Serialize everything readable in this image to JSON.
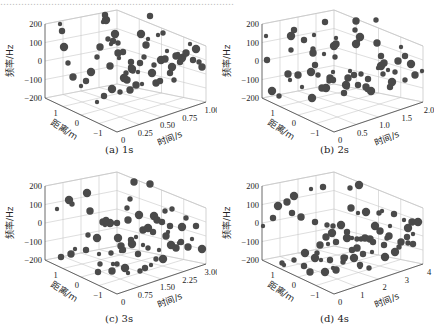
{
  "figure": {
    "top_text_fragment": "……………………………………………………………………",
    "panels": [
      {
        "id": "a",
        "caption": "(a) 1s",
        "time_ticks": [
          "0",
          "0.25",
          "0.50",
          "0.75",
          "1.00"
        ]
      },
      {
        "id": "b",
        "caption": "(b) 2s",
        "time_ticks": [
          "0",
          "0.5",
          "1.0",
          "1.5",
          "2.0"
        ]
      },
      {
        "id": "c",
        "caption": "(c) 3s",
        "time_ticks": [
          "0",
          "0.75",
          "1.50",
          "2.25",
          "3.00"
        ]
      },
      {
        "id": "d",
        "caption": "(d) 4s",
        "time_ticks": [
          "0",
          "1",
          "2",
          "3",
          "4"
        ]
      }
    ],
    "z_label": "频率/Hz",
    "y_label": "距离/m",
    "x_label": "时间/s",
    "z_ticks": [
      "200",
      "100",
      "0",
      "−100",
      "−200"
    ],
    "y_ticks": [
      "1",
      "0",
      "−1"
    ],
    "point_color": "#4a4a4a",
    "grid_color": "#c8c8c8"
  },
  "chart_data": [
    {
      "type": "scatter",
      "title": "(a) 1s",
      "xlabel": "时间/s",
      "ylabel": "距离/m",
      "zlabel": "频率/Hz",
      "xlim": [
        0,
        1.0
      ],
      "ylim": [
        -1.5,
        1.5
      ],
      "zlim": [
        -200,
        200
      ],
      "x_ticks": [
        0,
        0.25,
        0.5,
        0.75,
        1.0
      ],
      "y_ticks": [
        1,
        0,
        -1
      ],
      "z_ticks": [
        200,
        100,
        0,
        -100,
        -200
      ],
      "grid": true,
      "screen_points": [
        [
          60,
          24
        ],
        [
          62,
          31
        ],
        [
          64,
          47
        ],
        [
          68,
          63
        ],
        [
          73,
          77
        ],
        [
          81,
          86
        ],
        [
          86,
          81
        ],
        [
          91,
          72
        ],
        [
          97,
          57
        ],
        [
          100,
          47
        ],
        [
          103,
          22
        ],
        [
          105,
          15
        ],
        [
          106,
          20
        ],
        [
          108,
          39
        ],
        [
          110,
          66
        ],
        [
          111,
          44
        ],
        [
          113,
          41
        ],
        [
          115,
          34
        ],
        [
          118,
          43
        ],
        [
          118,
          53
        ],
        [
          119,
          58
        ],
        [
          123,
          52
        ],
        [
          124,
          78
        ],
        [
          126,
          73
        ],
        [
          127,
          80
        ],
        [
          130,
          67
        ],
        [
          131,
          62
        ],
        [
          132,
          69
        ],
        [
          133,
          71
        ],
        [
          136,
          85
        ],
        [
          138,
          72
        ],
        [
          140,
          63
        ],
        [
          141,
          34
        ],
        [
          144,
          57
        ],
        [
          146,
          45
        ],
        [
          148,
          39
        ],
        [
          150,
          16
        ],
        [
          152,
          73
        ],
        [
          154,
          65
        ],
        [
          156,
          83
        ],
        [
          158,
          35
        ],
        [
          160,
          81
        ],
        [
          161,
          60
        ],
        [
          163,
          33
        ],
        [
          165,
          59
        ],
        [
          167,
          51
        ],
        [
          170,
          73
        ],
        [
          172,
          67
        ],
        [
          174,
          80
        ],
        [
          176,
          56
        ],
        [
          178,
          54
        ],
        [
          180,
          62
        ],
        [
          182,
          58
        ],
        [
          184,
          56
        ],
        [
          186,
          53
        ],
        [
          190,
          44
        ],
        [
          193,
          60
        ],
        [
          196,
          49
        ],
        [
          199,
          62
        ],
        [
          202,
          67
        ],
        [
          97,
          102
        ],
        [
          104,
          96
        ],
        [
          112,
          89
        ],
        [
          120,
          92
        ],
        [
          130,
          90
        ],
        [
          142,
          84
        ]
      ],
      "note": "Approximate rendered screen positions of spheres (bubble size indicates depth)."
    },
    {
      "type": "scatter",
      "title": "(b) 2s",
      "xlabel": "时间/s",
      "ylabel": "距离/m",
      "zlabel": "频率/Hz",
      "xlim": [
        0,
        2.0
      ],
      "ylim": [
        -1.5,
        1.5
      ],
      "zlim": [
        -200,
        200
      ],
      "x_ticks": [
        0,
        0.5,
        1.0,
        1.5,
        2.0
      ],
      "y_ticks": [
        1,
        0,
        -1
      ],
      "z_ticks": [
        200,
        100,
        0,
        -100,
        -200
      ],
      "grid": true,
      "screen_points": [
        [
          266,
          36
        ],
        [
          267,
          60
        ],
        [
          272,
          91
        ],
        [
          279,
          96
        ],
        [
          288,
          74
        ],
        [
          290,
          80
        ],
        [
          294,
          30
        ],
        [
          291,
          36
        ],
        [
          291,
          50
        ],
        [
          298,
          75
        ],
        [
          302,
          87
        ],
        [
          304,
          40
        ],
        [
          311,
          72
        ],
        [
          313,
          49
        ],
        [
          313,
          53
        ],
        [
          314,
          35
        ],
        [
          315,
          65
        ],
        [
          312,
          98
        ],
        [
          318,
          75
        ],
        [
          322,
          88
        ],
        [
          324,
          54
        ],
        [
          325,
          22
        ],
        [
          326,
          88
        ],
        [
          329,
          81
        ],
        [
          330,
          78
        ],
        [
          333,
          72
        ],
        [
          333,
          80
        ],
        [
          334,
          46
        ],
        [
          335,
          57
        ],
        [
          336,
          44
        ],
        [
          336,
          38
        ],
        [
          344,
          93
        ],
        [
          346,
          85
        ],
        [
          347,
          87
        ],
        [
          348,
          78
        ],
        [
          350,
          71
        ],
        [
          354,
          75
        ],
        [
          356,
          44
        ],
        [
          355,
          30
        ],
        [
          356,
          21
        ],
        [
          358,
          41
        ],
        [
          358,
          85
        ],
        [
          360,
          37
        ],
        [
          361,
          74
        ],
        [
          366,
          87
        ],
        [
          367,
          90
        ],
        [
          368,
          79
        ],
        [
          371,
          91
        ],
        [
          376,
          20
        ],
        [
          377,
          43
        ],
        [
          378,
          68
        ],
        [
          381,
          56
        ],
        [
          381,
          66
        ],
        [
          383,
          74
        ],
        [
          384,
          63
        ],
        [
          388,
          70
        ],
        [
          390,
          87
        ],
        [
          392,
          82
        ],
        [
          395,
          72
        ],
        [
          398,
          61
        ],
        [
          401,
          47
        ],
        [
          405,
          56
        ],
        [
          411,
          64
        ],
        [
          405,
          80
        ],
        [
          415,
          75
        ],
        [
          422,
          71
        ]
      ],
      "note": "Approximate rendered screen positions of spheres."
    },
    {
      "type": "scatter",
      "title": "(c) 3s",
      "xlabel": "时间/s",
      "ylabel": "距离/m",
      "zlabel": "频率/Hz",
      "xlim": [
        0,
        3.0
      ],
      "ylim": [
        -1.5,
        1.5
      ],
      "zlim": [
        -200,
        200
      ],
      "x_ticks": [
        0,
        0.75,
        1.5,
        2.25,
        3.0
      ],
      "y_ticks": [
        1,
        0,
        -1
      ],
      "z_ticks": [
        200,
        100,
        0,
        -100,
        -200
      ],
      "grid": true,
      "screen_points": [
        [
          57,
          209
        ],
        [
          61,
          257
        ],
        [
          69,
          200
        ],
        [
          72,
          204
        ],
        [
          71,
          254
        ],
        [
          75,
          249
        ],
        [
          86,
          250
        ],
        [
          87,
          193
        ],
        [
          88,
          235
        ],
        [
          90,
          211
        ],
        [
          99,
          254
        ],
        [
          98,
          272
        ],
        [
          97,
          238
        ],
        [
          100,
          264
        ],
        [
          103,
          222
        ],
        [
          105,
          225
        ],
        [
          106,
          220
        ],
        [
          110,
          223
        ],
        [
          111,
          253
        ],
        [
          112,
          271
        ],
        [
          113,
          264
        ],
        [
          117,
          223
        ],
        [
          118,
          238
        ],
        [
          117,
          264
        ],
        [
          121,
          246
        ],
        [
          121,
          251
        ],
        [
          123,
          250
        ],
        [
          125,
          268
        ],
        [
          127,
          208
        ],
        [
          128,
          220
        ],
        [
          128,
          273
        ],
        [
          131,
          240
        ],
        [
          132,
          244
        ],
        [
          130,
          199
        ],
        [
          134,
          182
        ],
        [
          136,
          237
        ],
        [
          138,
          254
        ],
        [
          139,
          215
        ],
        [
          140,
          271
        ],
        [
          143,
          230
        ],
        [
          143,
          245
        ],
        [
          145,
          268
        ],
        [
          148,
          228
        ],
        [
          148,
          248
        ],
        [
          150,
          184
        ],
        [
          151,
          265
        ],
        [
          153,
          232
        ],
        [
          154,
          216
        ],
        [
          156,
          259
        ],
        [
          157,
          220
        ],
        [
          159,
          250
        ],
        [
          162,
          222
        ],
        [
          163,
          259
        ],
        [
          165,
          211
        ],
        [
          166,
          236
        ],
        [
          168,
          232
        ],
        [
          170,
          226
        ],
        [
          171,
          245
        ],
        [
          173,
          246
        ],
        [
          176,
          248
        ],
        [
          179,
          243
        ],
        [
          181,
          242
        ],
        [
          182,
          227
        ],
        [
          186,
          218
        ],
        [
          188,
          247
        ],
        [
          192,
          239
        ],
        [
          196,
          226
        ],
        [
          202,
          249
        ],
        [
          172,
          209
        ]
      ],
      "note": "Approximate rendered screen positions of spheres."
    },
    {
      "type": "scatter",
      "title": "(d) 4s",
      "xlabel": "时间/s",
      "ylabel": "距离/m",
      "zlabel": "频率/Hz",
      "xlim": [
        0,
        4
      ],
      "ylim": [
        -1.5,
        1.5
      ],
      "zlim": [
        -200,
        200
      ],
      "x_ticks": [
        0,
        1,
        2,
        3,
        4
      ],
      "y_ticks": [
        1,
        0,
        -1
      ],
      "z_ticks": [
        200,
        100,
        0,
        -100,
        -200
      ],
      "grid": true,
      "screen_points": [
        [
          263,
          226
        ],
        [
          273,
          218
        ],
        [
          278,
          206
        ],
        [
          282,
          263
        ],
        [
          287,
          202
        ],
        [
          284,
          265
        ],
        [
          292,
          213
        ],
        [
          294,
          196
        ],
        [
          294,
          260
        ],
        [
          301,
          217
        ],
        [
          302,
          218
        ],
        [
          304,
          266
        ],
        [
          305,
          253
        ],
        [
          305,
          254
        ],
        [
          310,
          272
        ],
        [
          311,
          189
        ],
        [
          315,
          222
        ],
        [
          315,
          258
        ],
        [
          317,
          253
        ],
        [
          320,
          245
        ],
        [
          321,
          260
        ],
        [
          323,
          187
        ],
        [
          325,
          272
        ],
        [
          327,
          225
        ],
        [
          326,
          237
        ],
        [
          328,
          244
        ],
        [
          330,
          260
        ],
        [
          332,
          233
        ],
        [
          333,
          226
        ],
        [
          336,
          270
        ],
        [
          333,
          268
        ],
        [
          336,
          242
        ],
        [
          341,
          225
        ],
        [
          343,
          262
        ],
        [
          344,
          258
        ],
        [
          346,
          257
        ],
        [
          347,
          232
        ],
        [
          347,
          238
        ],
        [
          350,
          188
        ],
        [
          351,
          208
        ],
        [
          352,
          238
        ],
        [
          352,
          250
        ],
        [
          354,
          258
        ],
        [
          357,
          239
        ],
        [
          357,
          248
        ],
        [
          358,
          213
        ],
        [
          360,
          265
        ],
        [
          359,
          185
        ],
        [
          361,
          239
        ],
        [
          365,
          238
        ],
        [
          360,
          267
        ],
        [
          363,
          254
        ],
        [
          366,
          212
        ],
        [
          369,
          268
        ],
        [
          370,
          239
        ],
        [
          372,
          252
        ],
        [
          373,
          242
        ],
        [
          375,
          226
        ],
        [
          379,
          213
        ],
        [
          380,
          231
        ],
        [
          382,
          211
        ],
        [
          384,
          245
        ],
        [
          385,
          257
        ],
        [
          387,
          238
        ],
        [
          389,
          236
        ],
        [
          390,
          226
        ],
        [
          394,
          214
        ],
        [
          395,
          252
        ],
        [
          399,
          247
        ],
        [
          401,
          242
        ],
        [
          404,
          220
        ],
        [
          407,
          237
        ],
        [
          408,
          228
        ],
        [
          408,
          243
        ],
        [
          412,
          222
        ],
        [
          413,
          234
        ],
        [
          413,
          244
        ],
        [
          418,
          222
        ]
      ],
      "note": "Approximate rendered screen positions of spheres."
    }
  ]
}
